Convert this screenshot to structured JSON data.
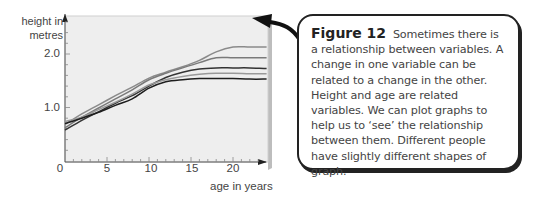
{
  "chart_data": {
    "type": "line",
    "title": "",
    "xlabel": "age in years",
    "ylabel": "height in metres",
    "xlim": [
      0,
      24
    ],
    "ylim": [
      0,
      2.4
    ],
    "x_ticks": [
      "0",
      "5",
      "10",
      "15",
      "20"
    ],
    "y_ticks": [
      "1.0",
      "2.0"
    ],
    "grid": false,
    "legend": null,
    "x": [
      0,
      2,
      4,
      6,
      8,
      10,
      12,
      14,
      16,
      18,
      20,
      22,
      24
    ],
    "series": [
      {
        "name": "person 1",
        "color": "#8a8a8a",
        "values": [
          0.68,
          0.88,
          1.05,
          1.22,
          1.38,
          1.55,
          1.66,
          1.76,
          1.88,
          2.04,
          2.13,
          2.13,
          2.13
        ]
      },
      {
        "name": "person 2",
        "color": "#7a7a7a",
        "values": [
          0.62,
          0.82,
          0.99,
          1.16,
          1.33,
          1.52,
          1.64,
          1.74,
          1.84,
          1.93,
          1.93,
          1.93,
          1.93
        ]
      },
      {
        "name": "person 3",
        "color": "#333333",
        "values": [
          0.58,
          0.76,
          0.92,
          1.08,
          1.22,
          1.4,
          1.56,
          1.66,
          1.72,
          1.74,
          1.74,
          1.74,
          1.73
        ]
      },
      {
        "name": "person 4",
        "color": "#999999",
        "values": [
          0.74,
          0.82,
          0.96,
          1.1,
          1.25,
          1.42,
          1.52,
          1.58,
          1.62,
          1.64,
          1.64,
          1.63,
          1.63
        ]
      },
      {
        "name": "person 5",
        "color": "#1e1e1e",
        "values": [
          0.7,
          0.8,
          0.91,
          1.04,
          1.16,
          1.36,
          1.48,
          1.52,
          1.54,
          1.54,
          1.54,
          1.53,
          1.53
        ]
      }
    ]
  },
  "axes": {
    "ylabel_line1": "height in",
    "ylabel_line2": "metres",
    "y_tick_2": "2.0",
    "y_tick_1": "1.0",
    "x_tick_0": "0",
    "x_tick_5": "5",
    "x_tick_10": "10",
    "x_tick_15": "15",
    "x_tick_20": "20",
    "xlabel": "age in years"
  },
  "caption": {
    "figure_label": "Figure 12",
    "text": "Sometimes there is a relationship between variables. A change in one variable can be related to a change in the other. Height and age are related variables. We can plot graphs to help us to ‘see’ the relationship between them. Different people have slightly different shapes of graph."
  }
}
